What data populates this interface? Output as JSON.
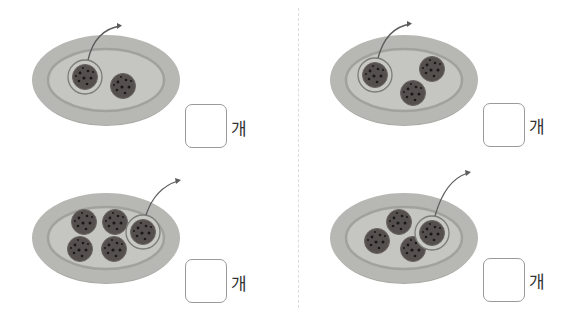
{
  "problems": [
    {
      "id": 1,
      "cookies_on_plate": 2,
      "cookies_taken": 1,
      "unit": "개",
      "answer": ""
    },
    {
      "id": 2,
      "cookies_on_plate": 3,
      "cookies_taken": 1,
      "unit": "개",
      "answer": ""
    },
    {
      "id": 3,
      "cookies_on_plate": 5,
      "cookies_taken": 1,
      "unit": "개",
      "answer": ""
    },
    {
      "id": 4,
      "cookies_on_plate": 4,
      "cookies_taken": 1,
      "unit": "개",
      "answer": ""
    }
  ],
  "colors": {
    "plate_outer": "#b5b5b1",
    "plate_rim": "#9e9e99",
    "plate_inner": "#c4c4c0",
    "cookie": "#55504e",
    "chip": "#1e1c1c",
    "circle_outline": "#7c7c78",
    "arrow": "#5c5c5c",
    "box_border": "#9a9a9a"
  }
}
